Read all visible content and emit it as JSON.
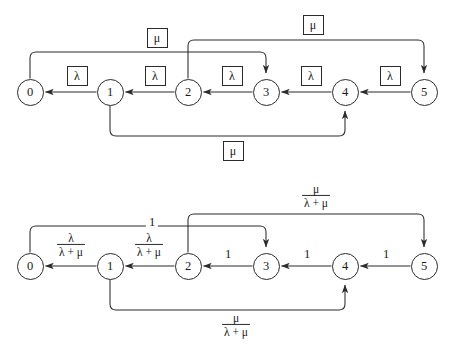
{
  "figure": {
    "kind": "markov-chain-state-transition-diagrams",
    "diagrams": [
      {
        "id": "top",
        "caption": "",
        "nodes": [
          {
            "id": "n0",
            "label": "0",
            "x": 30,
            "y": 92
          },
          {
            "id": "n1",
            "label": "1",
            "x": 110,
            "y": 92
          },
          {
            "id": "n2",
            "label": "2",
            "x": 188,
            "y": 92
          },
          {
            "id": "n3",
            "label": "3",
            "x": 266,
            "y": 92
          },
          {
            "id": "n4",
            "label": "4",
            "x": 345,
            "y": 92
          },
          {
            "id": "n5",
            "label": "5",
            "x": 424,
            "y": 92
          }
        ],
        "edges": [
          {
            "from": "1",
            "to": "0",
            "label": "λ",
            "boxed": true,
            "label_x": 77,
            "label_y": 76
          },
          {
            "from": "2",
            "to": "1",
            "label": "λ",
            "boxed": true,
            "label_x": 155,
            "label_y": 76
          },
          {
            "from": "3",
            "to": "2",
            "label": "λ",
            "boxed": true,
            "label_x": 232,
            "label_y": 76
          },
          {
            "from": "4",
            "to": "3",
            "label": "λ",
            "boxed": true,
            "label_x": 311,
            "label_y": 76
          },
          {
            "from": "5",
            "to": "4",
            "label": "λ",
            "boxed": true,
            "label_x": 390,
            "label_y": 76
          },
          {
            "from": "0",
            "to": "3",
            "label": "μ",
            "boxed": true,
            "label_x": 157,
            "label_y": 38
          },
          {
            "from": "2",
            "to": "5",
            "label": "μ",
            "boxed": true,
            "label_x": 313,
            "label_y": 25
          },
          {
            "from": "1",
            "to": "4",
            "label": "μ",
            "boxed": true,
            "label_x": 233,
            "label_y": 151
          }
        ]
      },
      {
        "id": "bottom",
        "caption": "",
        "nodes": [
          {
            "id": "m0",
            "label": "0",
            "x": 30,
            "y": 266
          },
          {
            "id": "m1",
            "label": "1",
            "x": 110,
            "y": 266
          },
          {
            "id": "m2",
            "label": "2",
            "x": 188,
            "y": 266
          },
          {
            "id": "m3",
            "label": "3",
            "x": 266,
            "y": 266
          },
          {
            "id": "m4",
            "label": "4",
            "x": 345,
            "y": 266
          },
          {
            "id": "m5",
            "label": "5",
            "x": 424,
            "y": 266
          }
        ],
        "edges": [
          {
            "from": "1",
            "to": "0",
            "type": "fraction",
            "numerator": "λ",
            "denominator": "λ + μ",
            "label_x": 71,
            "label_y": 245
          },
          {
            "from": "2",
            "to": "1",
            "type": "fraction",
            "numerator": "λ",
            "denominator": "λ + μ",
            "label_x": 149,
            "label_y": 245
          },
          {
            "from": "3",
            "to": "2",
            "type": "plain",
            "label": "1",
            "label_x": 228,
            "label_y": 254
          },
          {
            "from": "4",
            "to": "3",
            "type": "plain",
            "label": "1",
            "label_x": 307,
            "label_y": 254
          },
          {
            "from": "5",
            "to": "4",
            "type": "plain",
            "label": "1",
            "label_x": 386,
            "label_y": 254
          },
          {
            "from": "0",
            "to": "3",
            "type": "plain",
            "label": "1",
            "label_x": 152,
            "label_y": 222
          },
          {
            "from": "2",
            "to": "5",
            "type": "fraction",
            "numerator": "μ",
            "denominator": "λ + μ",
            "label_x": 316,
            "label_y": 196
          },
          {
            "from": "1",
            "to": "4",
            "type": "fraction",
            "numerator": "μ",
            "denominator": "λ + μ",
            "label_x": 236,
            "label_y": 325
          }
        ]
      }
    ],
    "colors": {
      "stroke": "#2b2b2b",
      "background": "#ffffff",
      "text": "#1a1a1a"
    }
  }
}
